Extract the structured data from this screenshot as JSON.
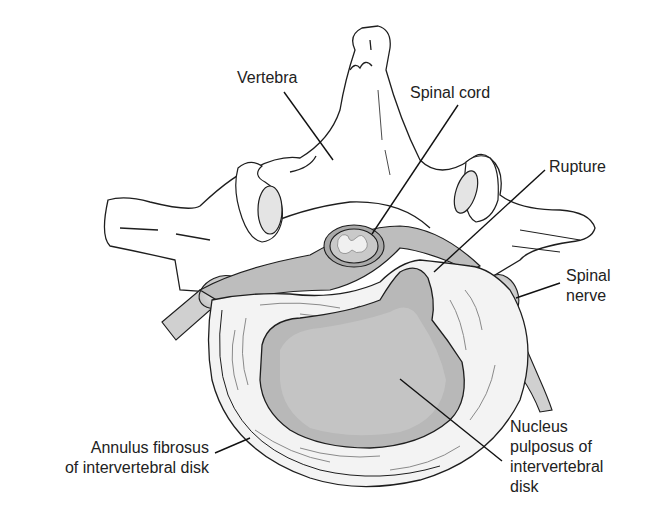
{
  "figure": {
    "colors": {
      "background": "#ffffff",
      "outline": "#1e1e1e",
      "bone": "#ffffff",
      "annulus": "#f2f2f2",
      "nucleus": "#b9b9b9",
      "nucleus_rim": "#a8a8a8",
      "dura": "#bcbcbc",
      "cord": "#c8c8c8",
      "cord_grey_matter": "#ececec",
      "nerve": "#cfcfcf",
      "facet": "#e4e4e4"
    },
    "labels": {
      "vertebra": "Vertebra",
      "spinal_cord": "Spinal cord",
      "rupture": "Rupture",
      "spinal_nerve_1": "Spinal",
      "spinal_nerve_2": "nerve",
      "annulus_1": "Annulus fibrosus",
      "annulus_2": "of intervertebral disk",
      "nucleus_1": "Nucleus",
      "nucleus_2": "pulposus of",
      "nucleus_3": "intervertebral",
      "nucleus_4": "disk"
    }
  }
}
